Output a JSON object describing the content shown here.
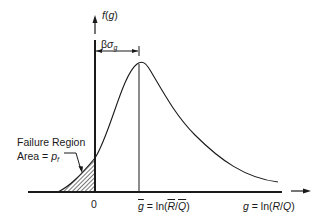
{
  "diagram": {
    "type": "probability-density-plot",
    "y_axis_label": {
      "func": "f",
      "arg": "g"
    },
    "x_axis_label": {
      "var": "g",
      "eq": " = ln(",
      "num": "R",
      "slash": "/",
      "den": "Q",
      "close": ")"
    },
    "origin_label": "0",
    "mean_label": {
      "var": "g",
      "eq": " = ln(",
      "num": "R",
      "slash": "/",
      "den": "Q",
      "close": ")"
    },
    "beta_label": {
      "beta": "β",
      "sigma": "σ",
      "sub": "g"
    },
    "failure_region": {
      "line1": "Failure Region",
      "line2_prefix": "Area = ",
      "pf_var": "p",
      "pf_sub": "f"
    },
    "colors": {
      "ink": "#1a1a1a",
      "background": "#ffffff"
    }
  }
}
